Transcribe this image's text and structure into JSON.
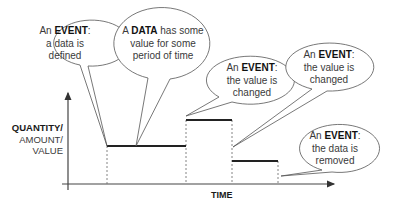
{
  "diagram": {
    "type": "step-timeline",
    "axes": {
      "y_label_lines": [
        "QUANTITY/",
        "AMOUNT/",
        "VALUE"
      ],
      "x_label": "TIME"
    },
    "colors": {
      "line": "#555555",
      "step": "#222222",
      "text": "#3a3a3a",
      "bold_text": "#111111"
    },
    "steps": [
      {
        "from": "t1",
        "to": "t2",
        "level": "medium"
      },
      {
        "from": "t2",
        "to": "t3",
        "level": "high"
      },
      {
        "from": "t3",
        "to": "t4",
        "level": "low"
      }
    ],
    "callouts": [
      {
        "id": "event-defined",
        "prefix": "An ",
        "bold": "EVENT",
        "suffix": ":",
        "line2": "a data is",
        "line3": "defined"
      },
      {
        "id": "data-period",
        "prefix": "A ",
        "bold": "DATA",
        "suffix": " has some",
        "line2": "value for some",
        "line3": "period of time"
      },
      {
        "id": "event-changed-1",
        "prefix": "An ",
        "bold": "EVENT",
        "suffix": ":",
        "line2": "the value is",
        "line3": "changed"
      },
      {
        "id": "event-changed-2",
        "prefix": "An ",
        "bold": "EVENT",
        "suffix": ":",
        "line2": "the value is",
        "line3": "changed"
      },
      {
        "id": "event-removed",
        "prefix": "An ",
        "bold": "EVENT",
        "suffix": ":",
        "line2": "the data is",
        "line3": "removed"
      }
    ]
  }
}
